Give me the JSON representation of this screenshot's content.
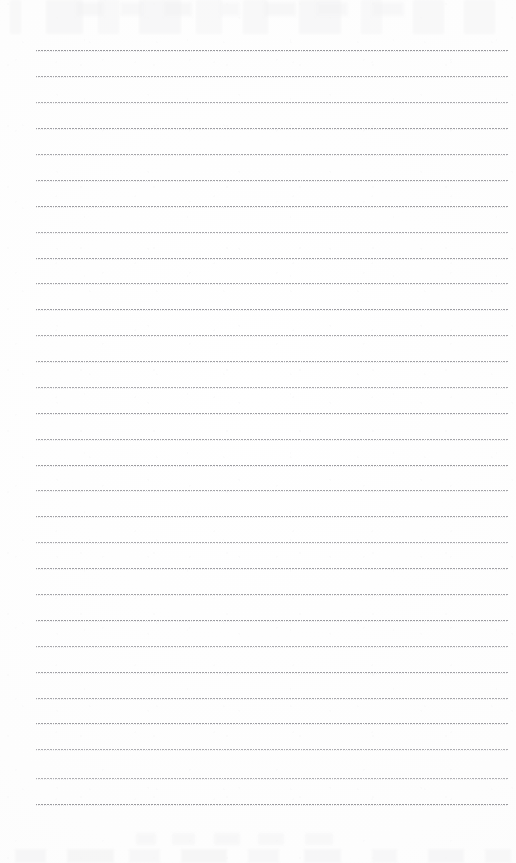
{
  "document": {
    "kind": "ruled-notebook-page",
    "title": "Blank ruled notebook page",
    "page_width": 516,
    "page_height": 863,
    "paper_color": "#fefefe",
    "written_content": "",
    "notes": "Scanned blank lined paper; no text, headings, numbers or handwriting are present on the sheet."
  },
  "ruling": {
    "style": "dotted",
    "line_color": "#8e8e93",
    "line_thickness_px": 1,
    "dot_pitch_px": 1.55,
    "line_count": 30,
    "first_line_y": 50,
    "line_spacing_px": 26,
    "line_start_x": 36,
    "line_end_x": 508,
    "lines": [
      {
        "index": 1,
        "y": 50,
        "x1": 36,
        "x2": 508,
        "opacity": 0.88
      },
      {
        "index": 2,
        "y": 76,
        "x1": 36,
        "x2": 508,
        "opacity": 0.8
      },
      {
        "index": 3,
        "y": 102,
        "x1": 36,
        "x2": 508,
        "opacity": 0.74
      },
      {
        "index": 4,
        "y": 128,
        "x1": 36,
        "x2": 508,
        "opacity": 0.84
      },
      {
        "index": 5,
        "y": 154,
        "x1": 36,
        "x2": 508,
        "opacity": 0.78
      },
      {
        "index": 6,
        "y": 180,
        "x1": 36,
        "x2": 508,
        "opacity": 0.82
      },
      {
        "index": 7,
        "y": 206,
        "x1": 36,
        "x2": 508,
        "opacity": 0.86
      },
      {
        "index": 8,
        "y": 232,
        "x1": 36,
        "x2": 508,
        "opacity": 0.76
      },
      {
        "index": 9,
        "y": 258,
        "x1": 36,
        "x2": 508,
        "opacity": 0.84
      },
      {
        "index": 10,
        "y": 283,
        "x1": 36,
        "x2": 508,
        "opacity": 0.8
      },
      {
        "index": 11,
        "y": 309,
        "x1": 36,
        "x2": 508,
        "opacity": 0.86
      },
      {
        "index": 12,
        "y": 335,
        "x1": 36,
        "x2": 508,
        "opacity": 0.78
      },
      {
        "index": 13,
        "y": 361,
        "x1": 36,
        "x2": 508,
        "opacity": 0.82
      },
      {
        "index": 14,
        "y": 387,
        "x1": 36,
        "x2": 508,
        "opacity": 0.76
      },
      {
        "index": 15,
        "y": 413,
        "x1": 36,
        "x2": 508,
        "opacity": 0.84
      },
      {
        "index": 16,
        "y": 439,
        "x1": 36,
        "x2": 508,
        "opacity": 0.8
      },
      {
        "index": 17,
        "y": 465,
        "x1": 36,
        "x2": 508,
        "opacity": 0.88
      },
      {
        "index": 18,
        "y": 490,
        "x1": 36,
        "x2": 508,
        "opacity": 0.78
      },
      {
        "index": 19,
        "y": 516,
        "x1": 36,
        "x2": 508,
        "opacity": 0.82
      },
      {
        "index": 20,
        "y": 542,
        "x1": 36,
        "x2": 508,
        "opacity": 0.74
      },
      {
        "index": 21,
        "y": 568,
        "x1": 36,
        "x2": 508,
        "opacity": 0.84
      },
      {
        "index": 22,
        "y": 594,
        "x1": 36,
        "x2": 508,
        "opacity": 0.8
      },
      {
        "index": 23,
        "y": 620,
        "x1": 36,
        "x2": 508,
        "opacity": 0.86
      },
      {
        "index": 24,
        "y": 646,
        "x1": 36,
        "x2": 508,
        "opacity": 0.76
      },
      {
        "index": 25,
        "y": 672,
        "x1": 36,
        "x2": 508,
        "opacity": 0.82
      },
      {
        "index": 26,
        "y": 698,
        "x1": 36,
        "x2": 508,
        "opacity": 0.78
      },
      {
        "index": 27,
        "y": 723,
        "x1": 36,
        "x2": 508,
        "opacity": 0.84
      },
      {
        "index": 28,
        "y": 749,
        "x1": 36,
        "x2": 508,
        "opacity": 0.72
      },
      {
        "index": 29,
        "y": 778,
        "x1": 36,
        "x2": 508,
        "opacity": 0.7
      },
      {
        "index": 30,
        "y": 804,
        "x1": 36,
        "x2": 508,
        "opacity": 0.88
      }
    ]
  },
  "artifacts": {
    "top_ghosting": "faint illegible bleed-through marks along the top edge",
    "bottom_ghosting": "faint illegible bleed-through marks along the bottom edge",
    "ghost_color": "#f3f3f4"
  }
}
